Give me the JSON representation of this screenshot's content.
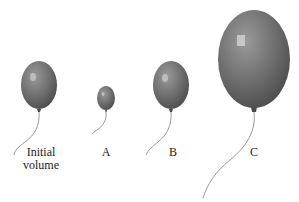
{
  "figure": {
    "balloons": [
      {
        "id": "initial",
        "label_line1": "Initial",
        "label_line2": "volume"
      },
      {
        "id": "A",
        "label": "A"
      },
      {
        "id": "B",
        "label": "B"
      },
      {
        "id": "C",
        "label": "C"
      }
    ],
    "colors": {
      "balloon_fill": "#6e6e6e",
      "balloon_dark": "#4a4a4a",
      "string": "#999999",
      "text": "#222222"
    }
  }
}
